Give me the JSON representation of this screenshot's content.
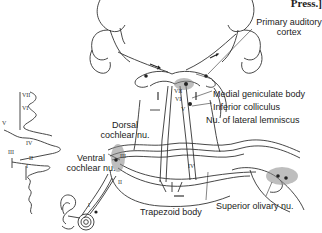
{
  "figure": {
    "corner_text": "Press.]",
    "labels": {
      "primary_auditory_cortex": "Primary auditory\ncortex",
      "medial_geniculate_body": "Medial geniculate body",
      "inferior_colliculus": "Inferior colliculus",
      "nu_lateral_lemniscus": "Nu. of lateral lemniscus",
      "dorsal_cochlear_nu": "Dorsal\ncochlear nu.",
      "ventral_cochlear_nu": "Ventral\ncochlear nu.",
      "trapezoid_body": "Trapezoid body",
      "superior_olivary_nu": "Superior olivary nu."
    },
    "waveform_peaks": [
      "VII",
      "VI",
      "V",
      "IV",
      "III",
      "II",
      "I"
    ],
    "pathway_numerals": {
      "vii": "VII",
      "vi": "VI",
      "v": "V",
      "iv": "IV",
      "iii": "III",
      "ii": "II",
      "i": "I"
    },
    "colors": {
      "line": "#333333",
      "shade": "#8a8a8a",
      "background": "#ffffff"
    }
  }
}
